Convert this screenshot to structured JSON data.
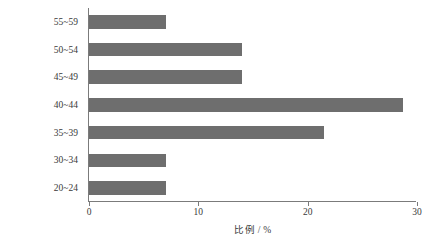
{
  "chart_data": {
    "type": "bar",
    "orientation": "horizontal",
    "title": "",
    "xlabel": "比例 / %",
    "ylabel": "年龄 / 岁",
    "categories": [
      "20~24",
      "30~34",
      "35~39",
      "40~44",
      "45~49",
      "50~54",
      "55~59"
    ],
    "values": [
      7.0,
      7.0,
      21.5,
      28.7,
      14.0,
      14.0,
      7.0
    ],
    "xlim": [
      0,
      30
    ],
    "xticks": [
      0,
      10,
      20,
      30
    ],
    "xtick_labels": [
      "0",
      "10",
      "20",
      "30"
    ],
    "grid": false,
    "legend": null,
    "bar_color": "#6e6e6e",
    "axis_color": "#7b7b7b",
    "background": "#ffffff"
  },
  "axes": {
    "x_title": "比例 / %",
    "y_title": "年龄 / 岁"
  }
}
